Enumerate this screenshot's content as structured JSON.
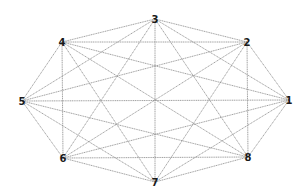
{
  "diagram": {
    "type": "complete-graph",
    "name": "K8",
    "edge_color": "#8a8a8a",
    "label_color": "#1a1a1a",
    "nodes": [
      {
        "id": "1",
        "label": "1",
        "x": 289,
        "y": 100
      },
      {
        "id": "2",
        "label": "2",
        "x": 247,
        "y": 42
      },
      {
        "id": "3",
        "label": "3",
        "x": 155,
        "y": 19
      },
      {
        "id": "4",
        "label": "4",
        "x": 62,
        "y": 42
      },
      {
        "id": "5",
        "label": "5",
        "x": 22,
        "y": 101
      },
      {
        "id": "6",
        "label": "6",
        "x": 63,
        "y": 158
      },
      {
        "id": "7",
        "label": "7",
        "x": 155,
        "y": 182
      },
      {
        "id": "8",
        "label": "8",
        "x": 248,
        "y": 157
      }
    ]
  }
}
